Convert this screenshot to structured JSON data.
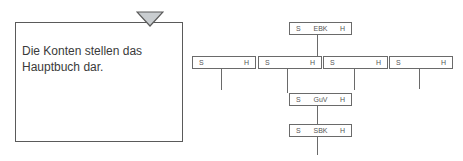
{
  "note": {
    "text_line1": "Die Konten stellen das",
    "text_line2": "Hauptbuch dar.",
    "marker_icon": "triangle-down-icon",
    "marker_color": "#c9cdd0",
    "border_color": "#5a5a5a"
  },
  "diagram": {
    "top_account": {
      "left": "S",
      "name": "EBK",
      "right": "H"
    },
    "accounts_row": [
      {
        "left": "S",
        "name": "",
        "right": "H"
      },
      {
        "left": "S",
        "name": "",
        "right": "H"
      },
      {
        "left": "S",
        "name": "",
        "right": "H"
      },
      {
        "left": "S",
        "name": "",
        "right": "H"
      }
    ],
    "guv_account": {
      "left": "S",
      "name": "GuV",
      "right": "H"
    },
    "sbk_account": {
      "left": "S",
      "name": "SBK",
      "right": "H"
    }
  }
}
